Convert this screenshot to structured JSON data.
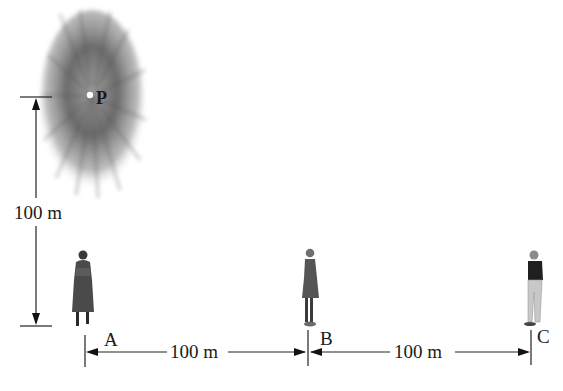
{
  "diagram": {
    "source_label": "P",
    "vertical_distance": "100 m",
    "segment_ab_distance": "100 m",
    "segment_bc_distance": "100 m",
    "observers": [
      {
        "label": "A",
        "description": "woman standing at point A"
      },
      {
        "label": "B",
        "description": "girl standing at point B"
      },
      {
        "label": "C",
        "description": "man standing at point C"
      }
    ],
    "source_icon": "burst-source-icon",
    "colors": {
      "line": "#222222",
      "burst": "#6e6e6e",
      "background": "#ffffff"
    }
  }
}
